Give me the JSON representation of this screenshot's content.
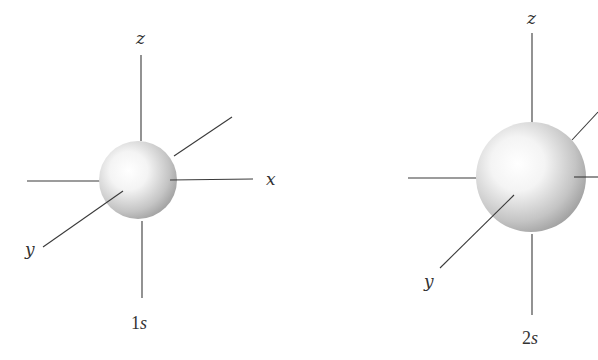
{
  "figure": {
    "orbitals": [
      {
        "name": "1s",
        "caption_number": "1",
        "caption_letter": "s",
        "axis_labels": {
          "z": "z",
          "x": "x",
          "y": "y"
        },
        "relative_size": "small"
      },
      {
        "name": "2s",
        "caption_number": "2",
        "caption_letter": "s",
        "axis_labels": {
          "z": "z",
          "x": "",
          "y": "y"
        },
        "relative_size": "large"
      }
    ],
    "colors": {
      "axis": "#3a3a3a",
      "sphere_highlight": "#ffffff",
      "sphere_shadow": "#9a9a9a",
      "text": "#333333"
    }
  }
}
